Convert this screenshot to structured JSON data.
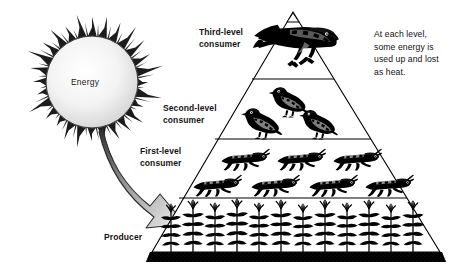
{
  "diagram": {
    "background_color": "#ffffff",
    "ink_color": "#000000"
  },
  "sun": {
    "label": "Energy",
    "icon": "sun-icon",
    "center_x": 92,
    "center_y": 82,
    "core_radius": 46,
    "ray_count": 28,
    "core_color": "#f2f2f2",
    "ray_color": "#1c1c1c"
  },
  "arrow": {
    "icon": "curved-arrow-icon",
    "description": "curved arrow from sun to producer level",
    "fill_start": "#3a3a3a",
    "fill_end": "#f4f4f4"
  },
  "labels": {
    "third_level": "Third-level\nconsumer",
    "second_level": "Second-level\nconsumer",
    "first_level": "First-level\nconsumer",
    "producer": "Producer",
    "note": "At each level,\nsome energy is\nused up and lost\nas heat."
  },
  "pyramid": {
    "apex_x": 293,
    "apex_y": 12,
    "base_left_x": 152,
    "base_right_x": 440,
    "base_y": 252,
    "ground_bar_color": "#000000",
    "ground_bar_height": 10,
    "outline_color": "#000000",
    "fill_color": "#ffffff",
    "dividers_y": [
      79,
      139,
      198
    ]
  },
  "chart_data": {
    "type": "pyramid",
    "levels": [
      {
        "rank": 4,
        "name": "Third-level consumer",
        "organism": "hawk",
        "organism_count": 1,
        "label_side": "left",
        "y_top": 12,
        "y_bottom": 79
      },
      {
        "rank": 3,
        "name": "Second-level consumer",
        "organism": "songbird",
        "organism_count": 3,
        "label_side": "left",
        "y_top": 79,
        "y_bottom": 139
      },
      {
        "rank": 2,
        "name": "First-level consumer",
        "organism": "grasshopper",
        "organism_count": 7,
        "label_side": "left",
        "y_top": 139,
        "y_bottom": 198
      },
      {
        "rank": 1,
        "name": "Producer",
        "organism": "corn plant",
        "organism_count": 12,
        "label_side": "left",
        "y_top": 198,
        "y_bottom": 252
      }
    ],
    "annotation": "At each level, some energy is used up and lost as heat.",
    "energy_source": "Energy"
  }
}
